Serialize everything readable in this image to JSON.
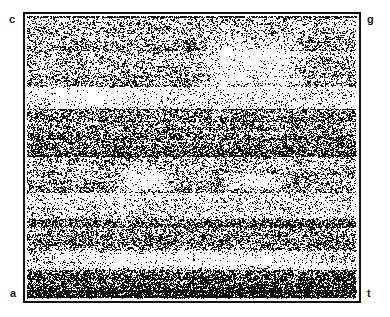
{
  "figure": {
    "kind": "chaos-game-representation",
    "background_color": "#ffffff",
    "point_color": "#111111",
    "frame_color": "#111111"
  },
  "labels": {
    "top_left": "c",
    "top_right": "g",
    "bottom_left": "a",
    "bottom_right": "t"
  },
  "chart_data": {
    "type": "scatter",
    "title": "",
    "subtitle": "",
    "xlabel": "",
    "ylabel": "",
    "xlim": [
      0,
      1
    ],
    "ylim": [
      0,
      1
    ],
    "grid": false,
    "legend": "none",
    "axis_ticks": [],
    "corner_vertices": [
      {
        "label": "c",
        "x": 0,
        "y": 1
      },
      {
        "label": "g",
        "x": 1,
        "y": 1
      },
      {
        "label": "a",
        "x": 0,
        "y": 0
      },
      {
        "label": "t",
        "x": 1,
        "y": 0
      }
    ],
    "n_points": 52000,
    "point_size_px": 1,
    "density_bands": [
      {
        "y_top": 0.0,
        "y_bottom": 0.135,
        "density": "medium-dark"
      },
      {
        "y_top": 0.135,
        "y_bottom": 0.25,
        "density": "medium"
      },
      {
        "y_top": 0.25,
        "y_bottom": 0.33,
        "density": "light"
      },
      {
        "y_top": 0.33,
        "y_bottom": 0.44,
        "density": "medium-dark"
      },
      {
        "y_top": 0.44,
        "y_bottom": 0.52,
        "density": "dark"
      },
      {
        "y_top": 0.52,
        "y_bottom": 0.63,
        "density": "medium"
      },
      {
        "y_top": 0.63,
        "y_bottom": 0.72,
        "density": "light"
      },
      {
        "y_top": 0.72,
        "y_bottom": 0.83,
        "density": "medium-dark"
      },
      {
        "y_top": 0.83,
        "y_bottom": 0.905,
        "density": "light"
      },
      {
        "y_top": 0.905,
        "y_bottom": 1.0,
        "density": "very-dark"
      }
    ],
    "sparse_regions": [
      {
        "x0": 0.5,
        "x1": 0.86,
        "y0": 0.04,
        "y1": 0.3,
        "note": "upper-middle-right void"
      },
      {
        "x0": 0.06,
        "x1": 0.34,
        "y0": 0.25,
        "y1": 0.33,
        "note": "upper-left band void"
      },
      {
        "x0": 0.25,
        "x1": 0.46,
        "y0": 0.53,
        "y1": 0.64,
        "note": "mid-left void"
      },
      {
        "x0": 0.58,
        "x1": 0.8,
        "y0": 0.55,
        "y1": 0.62,
        "note": "mid-right void"
      },
      {
        "x0": 0.02,
        "x1": 0.98,
        "y0": 0.83,
        "y1": 0.9,
        "note": "lower horizontal void"
      }
    ],
    "base_frequencies": {
      "a": 0.29,
      "c": 0.21,
      "g": 0.21,
      "t": 0.29
    }
  }
}
